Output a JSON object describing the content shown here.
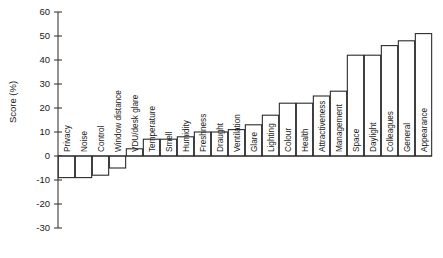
{
  "chart_data": {
    "type": "bar",
    "title": "",
    "xlabel": "",
    "ylabel": "Score (%)",
    "ylim": [
      -30,
      60
    ],
    "ytick_values": [
      60,
      50,
      40,
      30,
      20,
      10,
      0,
      -10,
      -20,
      -30
    ],
    "ytick_labels": [
      "60",
      "50",
      "40",
      "30",
      "20",
      "10",
      "0",
      "-10",
      "-20",
      "-30"
    ],
    "grid": false,
    "legend": null,
    "orientation": "vertical",
    "categories": [
      "Privacy",
      "Noise",
      "Control",
      "Window distance",
      "VDU/desk glare",
      "Temperature",
      "Smell",
      "Humidity",
      "Freshness",
      "Draught",
      "Ventilation",
      "Glare",
      "Lighting",
      "Colour",
      "Health",
      "Attractiveness",
      "Management",
      "Space",
      "Daylight",
      "Colleagues",
      "General",
      "Appearance"
    ],
    "values": [
      -9,
      -9,
      -8,
      -5,
      3,
      7,
      7,
      8,
      10,
      10,
      11,
      13,
      17,
      22,
      22,
      25,
      27,
      42,
      42,
      46,
      48,
      51
    ],
    "bar_style": {
      "fill": "#ffffff",
      "stroke": "#2b2b2b"
    }
  },
  "caption": {
    "text": ""
  }
}
